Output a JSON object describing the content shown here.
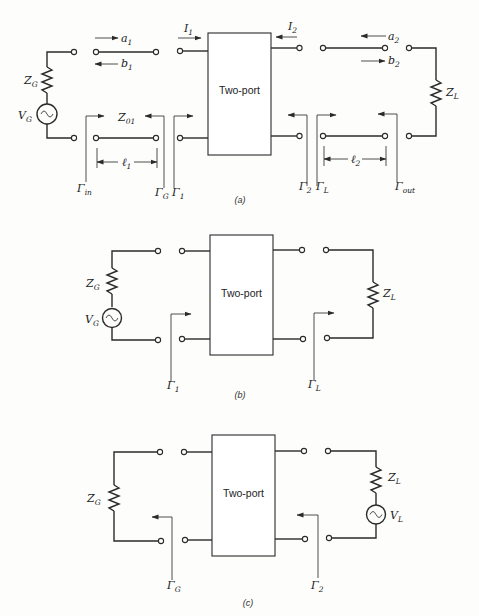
{
  "colors": {
    "ink": "#2a2a2a",
    "paper": "#fdfdfc"
  },
  "labels": {
    "two_port": "Two-port",
    "Z": "Z",
    "V": "V",
    "Gamma": "Γ",
    "a": "a",
    "b": "b",
    "I": "I",
    "ell": "ℓ",
    "sub_G": "G",
    "sub_L": "L",
    "sub_1": "1",
    "sub_2": "2",
    "sub_01": "01",
    "sub_in": "in",
    "sub_out": "out"
  },
  "captions": {
    "a": "(a)",
    "b": "(b)",
    "c": "(c)"
  },
  "icons": {
    "source": "ac-voltage-source-icon",
    "resistor": "resistor-icon",
    "terminal": "terminal-icon",
    "arrow": "arrow-icon"
  }
}
